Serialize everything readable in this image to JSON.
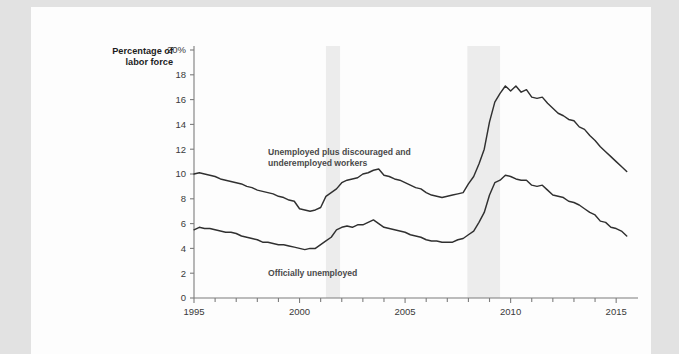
{
  "figure": {
    "axis_title_line1": "Percentage of",
    "axis_title_line2": "labor force",
    "series_label_u6_line1": "Unemployed plus discouraged and",
    "series_label_u6_line2": "underemployed workers",
    "series_label_u3": "Officially unemployed",
    "line_color": "#303030",
    "recession_color": "#ececec",
    "page_background": "#fdfdfd",
    "margin_background": "#e2e2e2"
  },
  "chart_data": {
    "type": "line",
    "title": "",
    "xlabel": "",
    "ylabel": "Percentage of labor force",
    "xlim": [
      1995,
      2015.75
    ],
    "ylim": [
      0,
      20
    ],
    "ytick_labels": [
      "0",
      "2",
      "4",
      "6",
      "8",
      "10",
      "12",
      "14",
      "16",
      "18",
      "20%"
    ],
    "yticks": [
      0,
      2,
      4,
      6,
      8,
      10,
      12,
      14,
      16,
      18,
      20
    ],
    "xtick_labels": [
      "1995",
      "2000",
      "2005",
      "2010",
      "2015"
    ],
    "xticks_major": [
      1995,
      2000,
      2005,
      2010,
      2015
    ],
    "xticks_minor": [
      1996,
      1997,
      1998,
      1999,
      2001,
      2002,
      2003,
      2004,
      2006,
      2007,
      2008,
      2009,
      2011,
      2012,
      2013,
      2014
    ],
    "grid": false,
    "legend_position": "inline-annotations",
    "annotations": [
      {
        "text": "Unemployed plus discouraged and underemployed workers",
        "x": 2002.0,
        "y": 12.3
      },
      {
        "text": "Officially unemployed",
        "x": 2002.0,
        "y": 2.6
      }
    ],
    "shaded_regions": [
      {
        "name": "recession-2001",
        "x0": 2001.25,
        "x1": 2001.92,
        "color": "#ececec"
      },
      {
        "name": "recession-2008",
        "x0": 2007.95,
        "x1": 2009.5,
        "color": "#ececec"
      }
    ],
    "series": [
      {
        "name": "Unemployed plus discouraged and underemployed workers",
        "x": [
          1995.0,
          1995.25,
          1995.5,
          1995.75,
          1996.0,
          1996.25,
          1996.5,
          1996.75,
          1997.0,
          1997.25,
          1997.5,
          1997.75,
          1998.0,
          1998.25,
          1998.5,
          1998.75,
          1999.0,
          1999.25,
          1999.5,
          1999.75,
          2000.0,
          2000.25,
          2000.5,
          2000.75,
          2001.0,
          2001.25,
          2001.5,
          2001.75,
          2002.0,
          2002.25,
          2002.5,
          2002.75,
          2003.0,
          2003.25,
          2003.5,
          2003.75,
          2004.0,
          2004.25,
          2004.5,
          2004.75,
          2005.0,
          2005.25,
          2005.5,
          2005.75,
          2006.0,
          2006.25,
          2006.5,
          2006.75,
          2007.0,
          2007.25,
          2007.5,
          2007.75,
          2008.0,
          2008.25,
          2008.5,
          2008.75,
          2009.0,
          2009.25,
          2009.5,
          2009.75,
          2010.0,
          2010.25,
          2010.5,
          2010.75,
          2011.0,
          2011.25,
          2011.5,
          2011.75,
          2012.0,
          2012.25,
          2012.5,
          2012.75,
          2013.0,
          2013.25,
          2013.5,
          2013.75,
          2014.0,
          2014.25,
          2014.5,
          2014.75,
          2015.0,
          2015.25,
          2015.5
        ],
        "values": [
          10.0,
          10.1,
          10.0,
          9.9,
          9.8,
          9.6,
          9.5,
          9.4,
          9.3,
          9.2,
          9.0,
          8.9,
          8.7,
          8.6,
          8.5,
          8.4,
          8.2,
          8.1,
          7.9,
          7.8,
          7.2,
          7.1,
          7.0,
          7.1,
          7.3,
          8.2,
          8.5,
          8.8,
          9.3,
          9.5,
          9.6,
          9.7,
          10.0,
          10.1,
          10.3,
          10.4,
          9.9,
          9.8,
          9.6,
          9.5,
          9.3,
          9.1,
          8.9,
          8.8,
          8.5,
          8.3,
          8.2,
          8.1,
          8.2,
          8.3,
          8.4,
          8.5,
          9.2,
          9.8,
          10.8,
          12.0,
          14.2,
          15.8,
          16.5,
          17.1,
          16.7,
          17.1,
          16.6,
          16.8,
          16.2,
          16.1,
          16.2,
          15.7,
          15.3,
          14.9,
          14.7,
          14.4,
          14.3,
          13.8,
          13.6,
          13.1,
          12.7,
          12.2,
          11.8,
          11.4,
          11.0,
          10.6,
          10.2
        ]
      },
      {
        "name": "Officially unemployed",
        "x": [
          1995.0,
          1995.25,
          1995.5,
          1995.75,
          1996.0,
          1996.25,
          1996.5,
          1996.75,
          1997.0,
          1997.25,
          1997.5,
          1997.75,
          1998.0,
          1998.25,
          1998.5,
          1998.75,
          1999.0,
          1999.25,
          1999.5,
          1999.75,
          2000.0,
          2000.25,
          2000.5,
          2000.75,
          2001.0,
          2001.25,
          2001.5,
          2001.75,
          2002.0,
          2002.25,
          2002.5,
          2002.75,
          2003.0,
          2003.25,
          2003.5,
          2003.75,
          2004.0,
          2004.25,
          2004.5,
          2004.75,
          2005.0,
          2005.25,
          2005.5,
          2005.75,
          2006.0,
          2006.25,
          2006.5,
          2006.75,
          2007.0,
          2007.25,
          2007.5,
          2007.75,
          2008.0,
          2008.25,
          2008.5,
          2008.75,
          2009.0,
          2009.25,
          2009.5,
          2009.75,
          2010.0,
          2010.25,
          2010.5,
          2010.75,
          2011.0,
          2011.25,
          2011.5,
          2011.75,
          2012.0,
          2012.25,
          2012.5,
          2012.75,
          2013.0,
          2013.25,
          2013.5,
          2013.75,
          2014.0,
          2014.25,
          2014.5,
          2014.75,
          2015.0,
          2015.25,
          2015.5
        ],
        "values": [
          5.5,
          5.7,
          5.6,
          5.6,
          5.5,
          5.4,
          5.3,
          5.3,
          5.2,
          5.0,
          4.9,
          4.8,
          4.7,
          4.5,
          4.5,
          4.4,
          4.3,
          4.3,
          4.2,
          4.1,
          4.0,
          3.9,
          4.0,
          4.0,
          4.3,
          4.6,
          4.9,
          5.5,
          5.7,
          5.8,
          5.7,
          5.9,
          5.9,
          6.1,
          6.3,
          6.0,
          5.7,
          5.6,
          5.5,
          5.4,
          5.3,
          5.1,
          5.0,
          4.9,
          4.7,
          4.6,
          4.6,
          4.5,
          4.5,
          4.5,
          4.7,
          4.8,
          5.1,
          5.4,
          6.1,
          6.9,
          8.3,
          9.3,
          9.5,
          9.9,
          9.8,
          9.6,
          9.5,
          9.5,
          9.1,
          9.0,
          9.1,
          8.7,
          8.3,
          8.2,
          8.1,
          7.8,
          7.7,
          7.5,
          7.2,
          6.9,
          6.7,
          6.2,
          6.1,
          5.7,
          5.6,
          5.4,
          5.0
        ]
      }
    ]
  }
}
